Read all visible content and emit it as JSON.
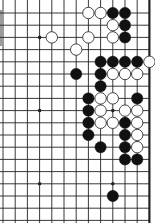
{
  "board": {
    "description": "Go board diagram fragment (upper-right area, right edge visible)",
    "line_color": "#222222",
    "background": "#ffffff",
    "black_color": "#111111",
    "white_color": "#ffffff",
    "origin_x": 3,
    "origin_y": 0.8,
    "spacing": 12.2,
    "columns": 13,
    "rows": 19,
    "first_visible_row": 1,
    "right_edge_column": 12,
    "star_points": [
      {
        "col": 3,
        "row": 3
      },
      {
        "col": 3,
        "row": 9
      },
      {
        "col": 9,
        "row": 9
      },
      {
        "col": 3,
        "row": 15
      },
      {
        "col": 9,
        "row": 15
      }
    ],
    "stones": [
      {
        "color": "white",
        "col": 7,
        "row": 1
      },
      {
        "color": "white",
        "col": 8,
        "row": 1
      },
      {
        "color": "black",
        "col": 9,
        "row": 1
      },
      {
        "color": "black",
        "col": 10,
        "row": 1
      },
      {
        "color": "white",
        "col": 9,
        "row": 2
      },
      {
        "color": "black",
        "col": 10,
        "row": 2
      },
      {
        "color": "white",
        "col": 4,
        "row": 3
      },
      {
        "color": "white",
        "col": 7,
        "row": 3
      },
      {
        "color": "white",
        "col": 9,
        "row": 3
      },
      {
        "color": "black",
        "col": 10,
        "row": 3
      },
      {
        "color": "white",
        "col": 6,
        "row": 4
      },
      {
        "color": "black",
        "col": 8,
        "row": 5
      },
      {
        "color": "black",
        "col": 9,
        "row": 5
      },
      {
        "color": "black",
        "col": 10,
        "row": 5
      },
      {
        "color": "black",
        "col": 11,
        "row": 5
      },
      {
        "color": "white",
        "col": 12,
        "row": 5
      },
      {
        "color": "black",
        "col": 6,
        "row": 6
      },
      {
        "color": "black",
        "col": 8,
        "row": 6
      },
      {
        "color": "white",
        "col": 9,
        "row": 6
      },
      {
        "color": "white",
        "col": 10,
        "row": 6
      },
      {
        "color": "white",
        "col": 11,
        "row": 6
      },
      {
        "color": "black",
        "col": 8,
        "row": 7
      },
      {
        "color": "black",
        "col": 7,
        "row": 8
      },
      {
        "color": "white",
        "col": 8,
        "row": 8
      },
      {
        "color": "white",
        "col": 9,
        "row": 8
      },
      {
        "color": "black",
        "col": 11,
        "row": 8
      },
      {
        "color": "black",
        "col": 7,
        "row": 9
      },
      {
        "color": "white",
        "col": 8,
        "row": 9
      },
      {
        "color": "white",
        "col": 10,
        "row": 9
      },
      {
        "color": "white",
        "col": 11,
        "row": 9
      },
      {
        "color": "black",
        "col": 7,
        "row": 10
      },
      {
        "color": "white",
        "col": 8,
        "row": 10
      },
      {
        "color": "white",
        "col": 9,
        "row": 10
      },
      {
        "color": "black",
        "col": 10,
        "row": 10
      },
      {
        "color": "white",
        "col": 11,
        "row": 10
      },
      {
        "color": "black",
        "col": 7,
        "row": 11
      },
      {
        "color": "black",
        "col": 10,
        "row": 11
      },
      {
        "color": "white",
        "col": 11,
        "row": 11
      },
      {
        "color": "black",
        "col": 8,
        "row": 12
      },
      {
        "color": "black",
        "col": 10,
        "row": 12
      },
      {
        "color": "white",
        "col": 11,
        "row": 12
      },
      {
        "color": "black",
        "col": 10,
        "row": 13
      },
      {
        "color": "black",
        "col": 11,
        "row": 13
      },
      {
        "color": "black",
        "col": 9,
        "row": 16
      }
    ]
  }
}
